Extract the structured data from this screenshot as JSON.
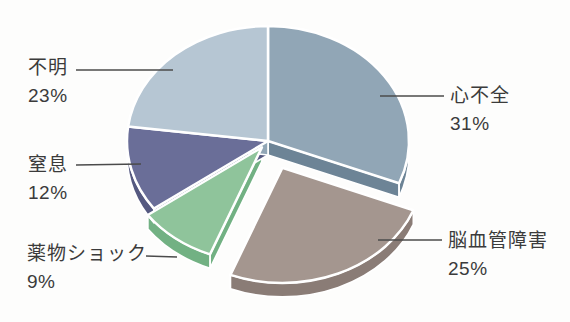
{
  "chart_data": {
    "type": "pie",
    "style": "3d-exploded-pie",
    "direction": "clockwise",
    "start_angle_deg": 0,
    "unit": "%",
    "legend": "none",
    "title": "",
    "slices": [
      {
        "label": "心不全",
        "value": 31,
        "display": "31%",
        "color": "#91a6b6",
        "side_color": "#6d8496",
        "explode": 0
      },
      {
        "label": "脳血管障害",
        "value": 25,
        "display": "25%",
        "color": "#a4968f",
        "side_color": "#8a7c76",
        "explode": 36
      },
      {
        "label": "薬物ショック",
        "value": 9,
        "display": "9%",
        "color": "#8fc49b",
        "side_color": "#72b183",
        "explode": 10
      },
      {
        "label": "窒息",
        "value": 12,
        "display": "12%",
        "color": "#6a6e98",
        "side_color": "#555980",
        "explode": 0
      },
      {
        "label": "不明",
        "value": 23,
        "display": "23%",
        "color": "#b6c6d3",
        "side_color": "#91a6b6",
        "explode": 0
      }
    ],
    "slice_outline_color": "#ffffff",
    "leader_line_color": "#4b4b4b",
    "label_text_color": "#3b3b3b",
    "background_color": "#fdfdfc"
  }
}
